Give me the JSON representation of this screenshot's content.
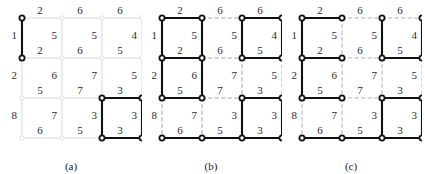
{
  "figure": {
    "panels": [
      {
        "id": "a",
        "caption": "(a)",
        "description": "grid graph with light gray background edges and a few bold selected edges"
      },
      {
        "id": "b",
        "caption": "(b)",
        "description": "grid graph with gray dashed unselected edges and bold selected edges"
      },
      {
        "id": "c",
        "caption": "(c)",
        "description": "grid graph with gray dashed and light unselected edges and bold spanning edges"
      }
    ]
  },
  "graph": {
    "rows": 4,
    "cols": 4,
    "spacing": 40,
    "horizontal_weights": [
      [
        2,
        6,
        6
      ],
      [
        2,
        6,
        5
      ],
      [
        5,
        7,
        3
      ],
      [
        6,
        5,
        3
      ]
    ],
    "vertical_weights": [
      [
        1,
        5,
        5,
        4
      ],
      [
        2,
        6,
        7,
        5
      ],
      [
        8,
        7,
        3,
        3
      ]
    ],
    "left_margin_weights": [
      2,
      6,
      6
    ],
    "colors": {
      "selected": "#111111",
      "unselected_light": "#dcdcdc",
      "unselected_dashed": "#9a9a9a",
      "node_fill": "#ffffff",
      "node_stroke_selected": "#111111",
      "node_stroke_light": "#dcdcdc",
      "weight_text": "#2b2b2b"
    }
  },
  "selection": {
    "a": {
      "horizontal": [
        [
          false,
          false,
          false
        ],
        [
          false,
          false,
          false
        ],
        [
          false,
          false,
          true
        ],
        [
          false,
          false,
          true
        ]
      ],
      "vertical": [
        [
          true,
          false,
          false,
          false
        ],
        [
          false,
          false,
          false,
          false
        ],
        [
          false,
          false,
          true,
          true
        ]
      ]
    },
    "b": {
      "horizontal": [
        [
          true,
          false,
          true
        ],
        [
          true,
          false,
          true
        ],
        [
          true,
          false,
          true
        ],
        [
          true,
          true,
          true
        ]
      ],
      "vertical": [
        [
          true,
          true,
          true,
          true
        ],
        [
          true,
          true,
          false,
          false
        ],
        [
          false,
          false,
          true,
          true
        ]
      ]
    },
    "c": {
      "horizontal": [
        [
          true,
          false,
          false
        ],
        [
          true,
          false,
          true
        ],
        [
          true,
          false,
          true
        ],
        [
          true,
          true,
          true
        ]
      ],
      "vertical": [
        [
          true,
          false,
          true,
          true
        ],
        [
          true,
          false,
          false,
          false
        ],
        [
          false,
          false,
          true,
          true
        ]
      ]
    }
  }
}
